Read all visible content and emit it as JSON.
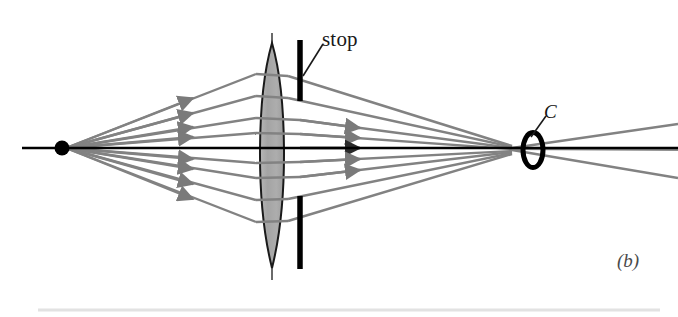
{
  "figure": {
    "panel_label": "(b)",
    "caption_labels": {
      "stop": "stop",
      "circle_of_least_confusion": "C"
    },
    "colors": {
      "background": "#ffffff",
      "ray": "#828282",
      "ray_dark": "#6e6e6e",
      "axis": "#000000",
      "lens_fill": "#a9a9a9",
      "lens_outline": "#1a1a1a",
      "stop_bar": "#000000",
      "source_point": "#000000",
      "confusion_ellipse": "#000000",
      "label_text": "#191919",
      "panel_label_text": "#4a4a4a",
      "footer_rule": "#e2e2e2"
    },
    "elements": {
      "source_point": {
        "cx": 62,
        "cy": 148,
        "r": 7
      },
      "optical_axis": {
        "x1": 22,
        "y1": 148,
        "x2": 678,
        "y2": 148,
        "width": 2.4
      },
      "lens": {
        "cx": 272,
        "cy": 148,
        "half_width": 16,
        "top_y": 43,
        "bottom_y": 268,
        "vertical_axis": {
          "top_y": 33,
          "bottom_y": 280
        }
      },
      "stop_upper_bar": {
        "x": 300,
        "y1": 40,
        "y2": 101,
        "width": 5
      },
      "stop_lower_bar": {
        "x": 300,
        "y1": 196,
        "y2": 269,
        "width": 5
      },
      "stop_leader_line": {
        "x1": 303,
        "y1": 76,
        "x2": 322,
        "y2": 44
      },
      "confusion_ellipse": {
        "cx": 533,
        "cy": 150,
        "rx": 10,
        "ry": 17,
        "stroke_width": 5
      },
      "c_leader_line": {
        "x1": 531,
        "y1": 137,
        "x2": 545,
        "y2": 116
      },
      "footer_rule": {
        "x1": 38,
        "y1": 310,
        "x2": 660,
        "y2": 310
      }
    },
    "rays": [
      {
        "id": "ray-1",
        "entry_y": 74,
        "focus_y": 146,
        "exit_slope_out": -12
      },
      {
        "id": "ray-2",
        "entry_y": 96,
        "focus_y": 147,
        "exit_slope_out": -7
      },
      {
        "id": "ray-3",
        "entry_y": 118,
        "focus_y": 148,
        "exit_slope_out": -3
      },
      {
        "id": "ray-4",
        "entry_y": 133,
        "focus_y": 149,
        "exit_slope_out": -1
      },
      {
        "id": "ray-axial",
        "entry_y": 148,
        "focus_y": 150,
        "exit_slope_out": 0
      },
      {
        "id": "ray-5",
        "entry_y": 163,
        "focus_y": 151,
        "exit_slope_out": 1
      },
      {
        "id": "ray-6",
        "entry_y": 178,
        "focus_y": 152,
        "exit_slope_out": 3
      },
      {
        "id": "ray-7",
        "entry_y": 200,
        "focus_y": 153,
        "exit_slope_out": 7
      },
      {
        "id": "ray-8",
        "entry_y": 222,
        "focus_y": 154,
        "exit_slope_out": 12
      }
    ],
    "diagram_meta": {
      "type": "optical-ray-diagram",
      "subject": "spherical aberration with aperture stop",
      "ray_count": 9,
      "arrow_count_incoming": 8,
      "arrow_count_outgoing": 5
    }
  }
}
